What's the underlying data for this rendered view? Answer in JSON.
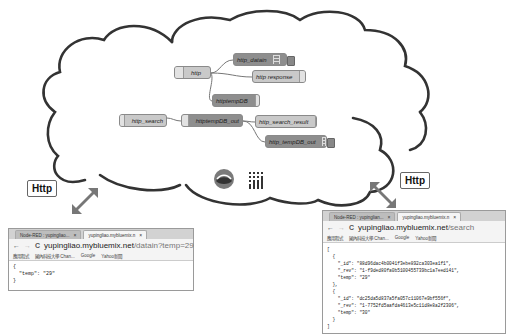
{
  "flow": {
    "nodes": {
      "http": "http",
      "http_datain": "http_datain",
      "http_response": "http response",
      "httptempDB": "httptempDB",
      "http_search": "http_search",
      "httptempDB_out": "httptempDB_out",
      "http_search_result": "http_search_result",
      "http_tempDB_out": "http_tempDB_out"
    }
  },
  "bubbles": {
    "left": "Http",
    "right": "Http"
  },
  "browser_left": {
    "tabs": [
      "Node-RED : yupingliao...",
      "yupingliao.mybluemix.n"
    ],
    "url_host": "yupingliao.mybluemix.net",
    "url_path": "/datain?temp=29",
    "bookmarks": [
      "應用程式",
      "國內科技大學 Chan...",
      "Google",
      "Yahoo新聞"
    ],
    "content": "{\n  \"temp\": \"29\"\n}"
  },
  "browser_right": {
    "tabs": [
      "Node-RED : yupinglian...",
      "yupingliao.mybluemix.n"
    ],
    "url_host": "yupingliao.mybluemix.net",
    "url_path": "/search",
    "bookmarks": [
      "應用程式",
      "國內科技大學 Chan...",
      "Google",
      "Yahoo新聞"
    ],
    "content": "[\n  {\n    \"_id\": \"88d96dac4b0041f3ebe892ca303ea1f1\",\n    \"_rev\": \"1-f9ded80fa0b5100455739bc1a7eed141\",\n    \"temp\": \"29\"\n  },\n  {\n    \"_id\": \"dc25da5d837a5fa057c11067e9bf556f\",\n    \"_rev\": \"1-7752fd5aafda4613e5c11d8e8a2f2306\",\n    \"temp\": \"30\"\n  }\n]"
  }
}
